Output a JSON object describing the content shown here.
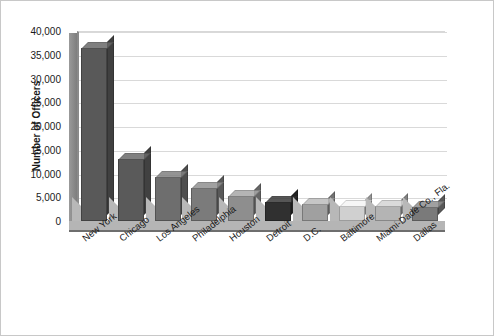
{
  "chart_data": {
    "type": "bar",
    "title": "",
    "subtitle": "",
    "xlabel": "",
    "ylabel": "Number of Officers",
    "ylim": [
      0,
      40000
    ],
    "grid": true,
    "legend": "none",
    "y_ticks": [
      "0",
      "5,000",
      "10,000",
      "15,000",
      "20,000",
      "25,000",
      "30,000",
      "35,000",
      "40,000"
    ],
    "y_tick_values": [
      0,
      5000,
      10000,
      15000,
      20000,
      25000,
      30000,
      35000,
      40000
    ],
    "categories": [
      "New York",
      "Chicago",
      "Los Angeles",
      "Philadelphia",
      "Houston",
      "Detroit",
      "D.C.",
      "Baltimore",
      "Miami-Dade Co., Fla.",
      "Dallas"
    ],
    "values": [
      36500,
      13000,
      9300,
      7000,
      5300,
      4000,
      3600,
      3200,
      3100,
      2900
    ],
    "bar_colors": [
      "#595959",
      "#5a5a5a",
      "#6e6e6e",
      "#7b7b7b",
      "#8e8e8e",
      "#303030",
      "#a0a0a0",
      "#d0d0d0",
      "#b4b4b4",
      "#7a7a7a"
    ]
  },
  "style": {
    "background": "#ffffff",
    "border": "#c8c8c8",
    "gridline": "#d9d9d9",
    "axis": "#6e6e6e",
    "floor": "#b5b5b5",
    "text": "#1a1a1a"
  }
}
